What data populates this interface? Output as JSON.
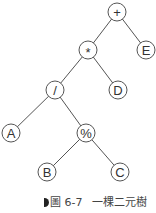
{
  "diagram": {
    "type": "binary-tree",
    "nodes": [
      {
        "id": "plus",
        "label": "+",
        "x": 117,
        "y": 12
      },
      {
        "id": "mul",
        "label": "*",
        "x": 88,
        "y": 50
      },
      {
        "id": "E",
        "label": "E",
        "x": 146,
        "y": 50
      },
      {
        "id": "div",
        "label": "/",
        "x": 55,
        "y": 90
      },
      {
        "id": "D",
        "label": "D",
        "x": 118,
        "y": 90
      },
      {
        "id": "A",
        "label": "A",
        "x": 11,
        "y": 133
      },
      {
        "id": "mod",
        "label": "%",
        "x": 86,
        "y": 133
      },
      {
        "id": "B",
        "label": "B",
        "x": 47,
        "y": 172
      },
      {
        "id": "C",
        "label": "C",
        "x": 120,
        "y": 172
      }
    ],
    "edges": [
      [
        "plus",
        "mul"
      ],
      [
        "plus",
        "E"
      ],
      [
        "mul",
        "div"
      ],
      [
        "mul",
        "D"
      ],
      [
        "div",
        "A"
      ],
      [
        "div",
        "mod"
      ],
      [
        "mod",
        "B"
      ],
      [
        "mod",
        "C"
      ]
    ]
  },
  "caption": {
    "figure_label": "圖 6-7",
    "text": "一棵二元樹"
  }
}
